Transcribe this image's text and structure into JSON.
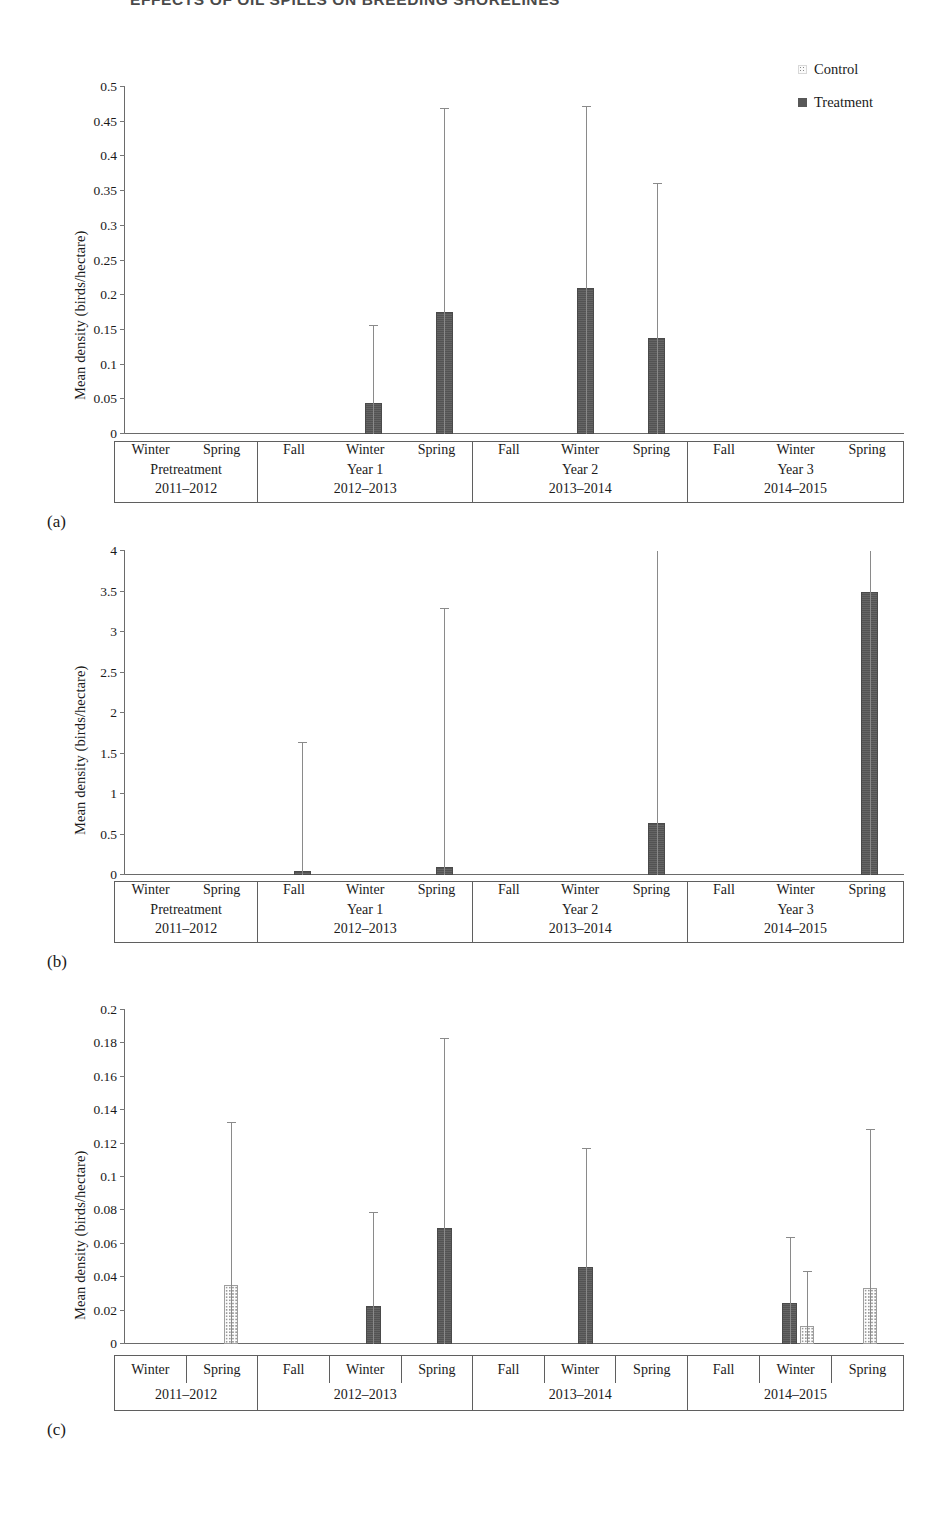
{
  "running_header": "EFFECTS OF OIL SPILLS ON BREEDING SHORELINES",
  "legend": {
    "items": [
      {
        "label": "Control",
        "swatch": "dotted-square-icon"
      },
      {
        "label": "Treatment",
        "swatch": "filled-square-icon"
      }
    ]
  },
  "axis_title": "Mean density (birds/hectare)",
  "panels": [
    {
      "letter": "(a)"
    },
    {
      "letter": "(b)"
    },
    {
      "letter": "(c)"
    }
  ],
  "chart_data": [
    {
      "id": "panel-a",
      "type": "bar",
      "title": "",
      "xlabel": "",
      "ylabel": "Mean density (birds/hectare)",
      "ylim": [
        0,
        0.5
      ],
      "ytick_step": 0.05,
      "yticks": [
        0,
        0.05,
        0.1,
        0.15,
        0.2,
        0.25,
        0.3,
        0.35,
        0.4,
        0.45,
        0.5
      ],
      "ytick_labels": [
        "0",
        "0.05",
        "0.1",
        "0.15",
        "0.2",
        "0.25",
        "0.3",
        "0.35",
        "0.4",
        "0.45",
        "0.5"
      ],
      "grid": false,
      "legend_position": "top-right",
      "groups": [
        {
          "name": "Pretreatment",
          "years": "2011–2012",
          "seasons": [
            "Winter",
            "Spring"
          ]
        },
        {
          "name": "Year 1",
          "years": "2012–2013",
          "seasons": [
            "Fall",
            "Winter",
            "Spring"
          ]
        },
        {
          "name": "Year 2",
          "years": "2013–2014",
          "seasons": [
            "Fall",
            "Winter",
            "Spring"
          ]
        },
        {
          "name": "Year 3",
          "years": "2014–2015",
          "seasons": [
            "Fall",
            "Winter",
            "Spring"
          ]
        }
      ],
      "categories": [
        "Pretreatment Winter",
        "Pretreatment Spring",
        "Year 1 Fall",
        "Year 1 Winter",
        "Year 1 Spring",
        "Year 2 Fall",
        "Year 2 Winter",
        "Year 2 Spring",
        "Year 3 Fall",
        "Year 3 Winter",
        "Year 3 Spring"
      ],
      "series": [
        {
          "name": "Control",
          "values": [
            0,
            0,
            0,
            0,
            0,
            0,
            0,
            0,
            0,
            0,
            0
          ],
          "error_high": [
            0,
            0,
            0,
            0,
            0,
            0,
            0,
            0,
            0,
            0,
            0
          ]
        },
        {
          "name": "Treatment",
          "values": [
            0,
            0,
            0,
            0.045,
            0.176,
            0,
            0.21,
            0.139,
            0,
            0,
            0
          ],
          "error_high": [
            0,
            0,
            0,
            0.157,
            0.47,
            0,
            0.473,
            0.362,
            0,
            0,
            0
          ]
        }
      ]
    },
    {
      "id": "panel-b",
      "type": "bar",
      "title": "",
      "xlabel": "",
      "ylabel": "Mean density (birds/hectare)",
      "ylim": [
        0,
        4
      ],
      "ytick_step": 0.5,
      "yticks": [
        0,
        0.5,
        1,
        1.5,
        2,
        2.5,
        3,
        3.5,
        4
      ],
      "ytick_labels": [
        "0",
        "0.5",
        "1",
        "1.5",
        "2",
        "2.5",
        "3",
        "3.5",
        "4"
      ],
      "grid": false,
      "legend_position": "none",
      "groups": [
        {
          "name": "Pretreatment",
          "years": "2011–2012",
          "seasons": [
            "Winter",
            "Spring"
          ]
        },
        {
          "name": "Year 1",
          "years": "2012–2013",
          "seasons": [
            "Fall",
            "Winter",
            "Spring"
          ]
        },
        {
          "name": "Year 2",
          "years": "2013–2014",
          "seasons": [
            "Fall",
            "Winter",
            "Spring"
          ]
        },
        {
          "name": "Year 3",
          "years": "2014–2015",
          "seasons": [
            "Fall",
            "Winter",
            "Spring"
          ]
        }
      ],
      "categories": [
        "Pretreatment Winter",
        "Pretreatment Spring",
        "Year 1 Fall",
        "Year 1 Winter",
        "Year 1 Spring",
        "Year 2 Fall",
        "Year 2 Winter",
        "Year 2 Spring",
        "Year 3 Fall",
        "Year 3 Winter",
        "Year 3 Spring"
      ],
      "series": [
        {
          "name": "Control",
          "values": [
            0,
            0,
            0,
            0,
            0,
            0,
            0,
            0,
            0,
            0,
            0
          ],
          "error_high": [
            0,
            0,
            0,
            0,
            0,
            0,
            0,
            0,
            0,
            0,
            0
          ]
        },
        {
          "name": "Treatment",
          "values": [
            0,
            0,
            0.05,
            0,
            0.1,
            0,
            0,
            0.64,
            0,
            0,
            3.49
          ],
          "error_high": [
            0,
            0,
            1.64,
            0,
            3.3,
            0,
            0,
            4.0,
            0,
            0,
            4.0
          ]
        }
      ]
    },
    {
      "id": "panel-c",
      "type": "bar",
      "title": "",
      "xlabel": "",
      "ylabel": "Mean density (birds/hectare)",
      "ylim": [
        0,
        0.2
      ],
      "ytick_step": 0.02,
      "yticks": [
        0,
        0.02,
        0.04,
        0.06,
        0.08,
        0.1,
        0.12,
        0.14,
        0.16,
        0.18,
        0.2
      ],
      "ytick_labels": [
        "0",
        "0.02",
        "0.04",
        "0.06",
        "0.08",
        "0.1",
        "0.12",
        "0.14",
        "0.16",
        "0.18",
        "0.2"
      ],
      "grid": false,
      "legend_position": "none",
      "groups": [
        {
          "name": "",
          "years": "2011–2012",
          "seasons": [
            "Winter",
            "Spring"
          ]
        },
        {
          "name": "",
          "years": "2012–2013",
          "seasons": [
            "Fall",
            "Winter",
            "Spring"
          ]
        },
        {
          "name": "",
          "years": "2013–2014",
          "seasons": [
            "Fall",
            "Winter",
            "Spring"
          ]
        },
        {
          "name": "",
          "years": "2014–2015",
          "seasons": [
            "Fall",
            "Winter",
            "Spring"
          ]
        }
      ],
      "categories": [
        "2011-2012 Winter",
        "2011-2012 Spring",
        "2012-2013 Fall",
        "2012-2013 Winter",
        "2012-2013 Spring",
        "2013-2014 Fall",
        "2013-2014 Winter",
        "2013-2014 Spring",
        "2014-2015 Fall",
        "2014-2015 Winter",
        "2014-2015 Spring"
      ],
      "series": [
        {
          "name": "Control",
          "values": [
            0,
            0.0355,
            0,
            0,
            0,
            0,
            0,
            0,
            0,
            0.011,
            0.0337
          ],
          "error_high": [
            0,
            0.133,
            0,
            0,
            0,
            0,
            0,
            0,
            0,
            0.044,
            0.129
          ]
        },
        {
          "name": "Treatment",
          "values": [
            0,
            0,
            0,
            0.023,
            0.0695,
            0,
            0.046,
            0,
            0,
            0.0243,
            0
          ],
          "error_high": [
            0,
            0,
            0,
            0.079,
            0.183,
            0,
            0.1175,
            0,
            0,
            0.064,
            0
          ]
        }
      ]
    }
  ]
}
